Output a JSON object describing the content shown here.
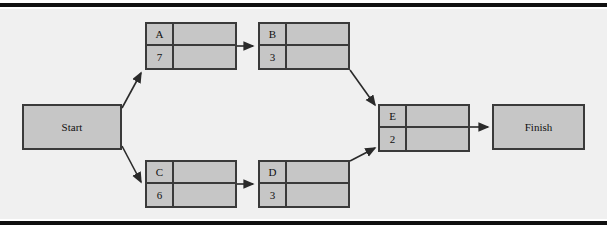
{
  "diagram": {
    "type": "project-network-diagram",
    "colors": {
      "node_fill": "#c6c6c6",
      "node_border": "#3a3a3a",
      "panel_background": "#f0f0f0",
      "rule": "#101010",
      "arrow": "#2a2a2a"
    },
    "terminals": [
      {
        "id": "start",
        "label": "Start",
        "x": 22,
        "y": 104,
        "w": 100,
        "h": 46
      },
      {
        "id": "finish",
        "label": "Finish",
        "x": 492,
        "y": 104,
        "w": 93,
        "h": 46
      }
    ],
    "activities": [
      {
        "id": "a",
        "name": "A",
        "duration": "7",
        "x": 145,
        "y": 22
      },
      {
        "id": "b",
        "name": "B",
        "duration": "3",
        "x": 258,
        "y": 22
      },
      {
        "id": "c",
        "name": "C",
        "duration": "6",
        "x": 145,
        "y": 160
      },
      {
        "id": "d",
        "name": "D",
        "duration": "3",
        "x": 258,
        "y": 160
      },
      {
        "id": "e",
        "name": "E",
        "duration": "2",
        "x": 378,
        "y": 104
      }
    ],
    "arrows": [
      {
        "id": "start-to-a",
        "from": "start",
        "to": "a",
        "path": "M 122,108 L 142,72"
      },
      {
        "id": "a-to-b",
        "from": "a",
        "to": "b",
        "path": "M 237,46 L 254,46"
      },
      {
        "id": "b-to-e",
        "from": "b",
        "to": "e",
        "path": "M 350,70 L 376,106"
      },
      {
        "id": "start-to-c",
        "from": "start",
        "to": "c",
        "path": "M 122,146 L 142,182"
      },
      {
        "id": "c-to-d",
        "from": "c",
        "to": "d",
        "path": "M 237,184 L 254,184"
      },
      {
        "id": "d-to-e",
        "from": "d",
        "to": "e",
        "path": "M 350,160 L 376,148"
      },
      {
        "id": "e-to-finish",
        "from": "e",
        "to": "finish",
        "path": "M 470,127 L 489,127"
      }
    ]
  }
}
